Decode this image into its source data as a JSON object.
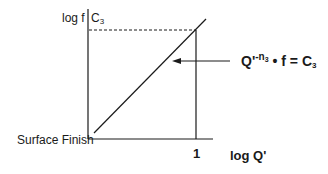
{
  "diagram": {
    "y_axis_label": "log f",
    "y_axis_top_label": "C",
    "y_axis_top_label_sub": "3",
    "x_axis_label": "log Q'",
    "x_tick_label": "1",
    "origin_label": "Surface Finish",
    "equation": {
      "base": "Q'",
      "exponent": "-n",
      "exponent_sub": "3",
      "middle": " • f = C",
      "rhs_sub": "3"
    },
    "line_color": "#1a1a1a"
  }
}
